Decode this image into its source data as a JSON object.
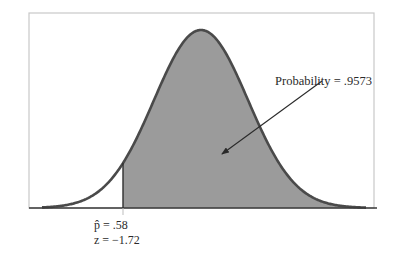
{
  "chart_data": {
    "type": "area",
    "title": "",
    "distribution": "normal",
    "xlabel": "",
    "ylabel": "",
    "grid": false,
    "legend": null,
    "cutoff": {
      "p_hat_label": "p̂ = .58",
      "z_label": "z = −1.72",
      "p_hat": 0.58,
      "z": -1.72
    },
    "shaded_region": "right of cutoff",
    "annotation": {
      "text": "Probability = .9573",
      "value": 0.9573
    }
  },
  "colors": {
    "fill": "#9b9b9b",
    "curve": "#4a4a4a",
    "axis": "#3a3a3a",
    "frame": "#c8c8c8",
    "text": "#2a2a2a"
  },
  "geometry": {
    "frame": {
      "x": 29,
      "y": 13,
      "w": 345,
      "h": 195
    },
    "axis_y": 208,
    "axis_x0": 29,
    "axis_x1": 377,
    "mean_x": 201,
    "peak_y": 30,
    "sigma_px": 47,
    "cutoff_x": 123,
    "tail_x0": 42,
    "tail_x1": 366,
    "arrow": {
      "x1": 322,
      "y1": 81,
      "x2": 222,
      "y2": 154
    }
  }
}
